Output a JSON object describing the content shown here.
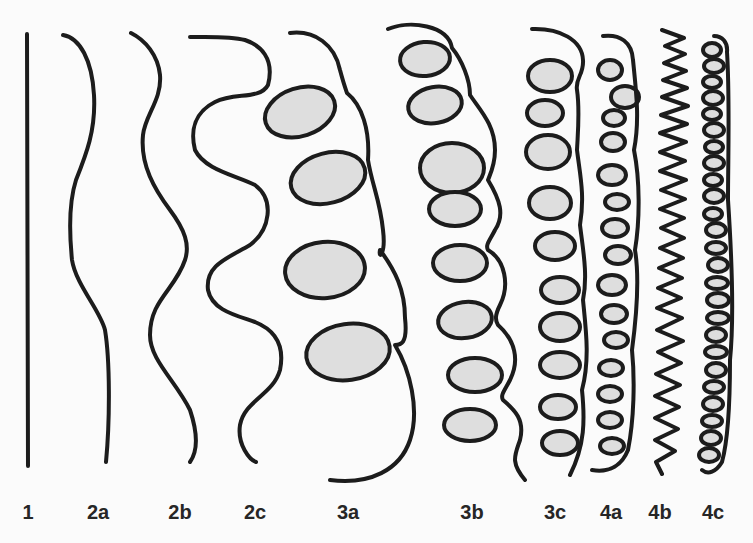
{
  "figure": {
    "colors": {
      "background": "#fbfbfb",
      "stroke": "#1c1c1c",
      "loop_fill": "#dedede",
      "label": "#262626"
    },
    "types": [
      {
        "id": "1",
        "label": "1",
        "x": 28,
        "description": "straight"
      },
      {
        "id": "2a",
        "label": "2a",
        "x": 98,
        "description": "slightly wavy"
      },
      {
        "id": "2b",
        "label": "2b",
        "x": 180,
        "description": "wavy"
      },
      {
        "id": "2c",
        "label": "2c",
        "x": 255,
        "description": "strongly wavy"
      },
      {
        "id": "3a",
        "label": "3a",
        "x": 348,
        "description": "large loops"
      },
      {
        "id": "3b",
        "label": "3b",
        "x": 472,
        "description": "medium loops"
      },
      {
        "id": "3c",
        "label": "3c",
        "x": 555,
        "description": "small loops"
      },
      {
        "id": "4a",
        "label": "4a",
        "x": 611,
        "description": "tight small loops"
      },
      {
        "id": "4b",
        "label": "4b",
        "x": 660,
        "description": "zig-zag"
      },
      {
        "id": "4c",
        "label": "4c",
        "x": 713,
        "description": "very tight coil"
      }
    ]
  }
}
